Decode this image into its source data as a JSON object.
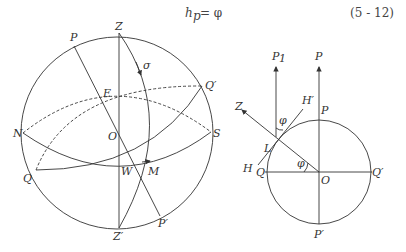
{
  "equation": {
    "lhs_main": "h",
    "lhs_sub": "p",
    "rhs": "= φ",
    "number": "(5 - 12)"
  },
  "left_figure": {
    "labels": {
      "Z": "Z",
      "P": "P",
      "sigma": "σ",
      "Q_prime": "Q′",
      "E": "E",
      "N": "N",
      "O": "O",
      "S": "S",
      "Q": "Q",
      "W": "W",
      "M": "M",
      "Z_prime": "Z′",
      "P_prime": "P′"
    }
  },
  "right_figure": {
    "labels": {
      "P1": "P",
      "P1_sub": "1",
      "P_top": "P",
      "Z": "Z",
      "H_prime": "H′",
      "phi_upper": "φ",
      "P_circle": "P",
      "L": "L",
      "phi_lower": "φ",
      "H": "H",
      "Q": "Q",
      "O": "O",
      "Q_prime": "Q′",
      "P_prime": "P′"
    }
  },
  "colors": {
    "stroke": "#333333",
    "background": "#ffffff"
  }
}
